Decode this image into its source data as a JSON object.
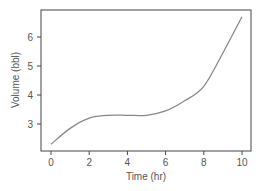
{
  "chart_data": {
    "type": "line",
    "title": "",
    "xlabel": "Time (hr)",
    "ylabel": "Volume (bbl)",
    "xlim": [
      -0.5,
      10.5
    ],
    "ylim": [
      2.1,
      6.9
    ],
    "xticks": [
      0,
      2,
      4,
      6,
      8,
      10
    ],
    "yticks": [
      3,
      4,
      5,
      6
    ],
    "grid": false,
    "legend": null,
    "series": [
      {
        "name": "Volume",
        "color": "#888888",
        "x": [
          0,
          1,
          2,
          3,
          4,
          5,
          6,
          7,
          8,
          9,
          10
        ],
        "y": [
          2.3,
          2.85,
          3.2,
          3.3,
          3.3,
          3.3,
          3.45,
          3.8,
          4.3,
          5.45,
          6.7
        ]
      }
    ]
  },
  "colors": {
    "frame": "#444444",
    "line": "#888888",
    "text": "#555555"
  }
}
